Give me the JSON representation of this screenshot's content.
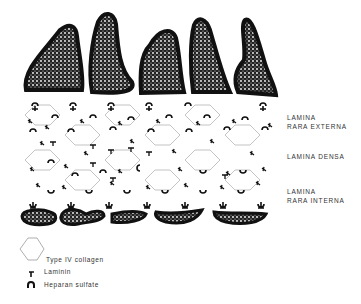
{
  "figure": {
    "layers": [
      {
        "line1": "LAMINA",
        "line2": "RARA EXTERNA",
        "top": 113
      },
      {
        "line1": "LAMINA DENSA",
        "line2": "",
        "top": 152
      },
      {
        "line1": "LAMINA",
        "line2": "RARA INTERNA",
        "top": 187
      }
    ],
    "legend": [
      {
        "icon": "hexagon-icon",
        "label": "Type IV collagen"
      },
      {
        "icon": "laminin-icon",
        "label": "Laminin"
      },
      {
        "icon": "heparan-sulfate-icon",
        "label": "Heparan sulfate"
      }
    ],
    "colors": {
      "ink": "#111111",
      "line": "#999999",
      "background": "#ffffff"
    }
  }
}
